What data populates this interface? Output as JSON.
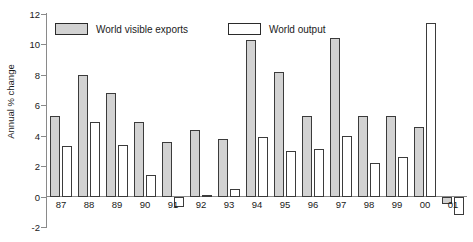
{
  "chart_data": {
    "type": "bar",
    "title": "",
    "xlabel": "",
    "ylabel": "Annual % change",
    "ylim": [
      -2,
      12
    ],
    "ytick_step": 2,
    "yticks": [
      12,
      10,
      8,
      6,
      4,
      2,
      0,
      -2
    ],
    "grid": false,
    "legend_position": "top",
    "categories": [
      "87",
      "88",
      "89",
      "90",
      "91",
      "92",
      "93",
      "94",
      "95",
      "96",
      "97",
      "98",
      "99",
      "00",
      "01"
    ],
    "series": [
      {
        "name": "World visible exports",
        "color": "#d2d2d2",
        "values": [
          5.3,
          8.0,
          6.8,
          4.9,
          3.6,
          4.4,
          3.8,
          10.3,
          8.2,
          5.3,
          10.4,
          5.3,
          5.3,
          4.6,
          -0.5
        ]
      },
      {
        "name": "World output",
        "color": "#ffffff",
        "values": [
          3.3,
          4.9,
          3.4,
          1.4,
          -0.7,
          0.1,
          0.5,
          3.9,
          3.0,
          3.1,
          4.0,
          2.2,
          2.6,
          11.4,
          -1.2
        ]
      }
    ]
  },
  "legend": {
    "items": [
      {
        "label": "World visible exports",
        "swatch": "gray"
      },
      {
        "label": "World output",
        "swatch": "white"
      }
    ]
  },
  "axis": {
    "y_title": "Annual % change",
    "y_ticks": [
      "12",
      "10",
      "8",
      "6",
      "4",
      "2",
      "0",
      "-2"
    ],
    "x_ticks": [
      "87",
      "88",
      "89",
      "90",
      "91",
      "92",
      "93",
      "94",
      "95",
      "96",
      "97",
      "98",
      "99",
      "00",
      "01"
    ]
  }
}
